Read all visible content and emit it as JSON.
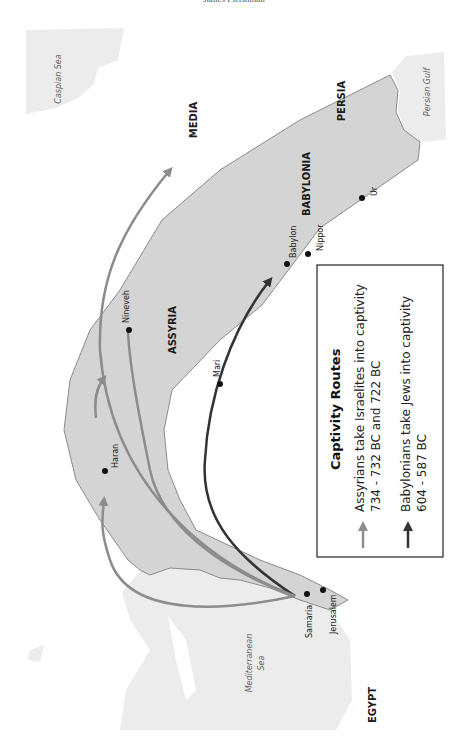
{
  "header": {
    "text": "James Fleishman"
  },
  "map": {
    "colors": {
      "region_fill": "#d4d4d4",
      "region_stroke": "#8a8a8a",
      "sea_fill": "#ececec",
      "assyrian_route": "#8c8c8c",
      "babylonian_route": "#333333",
      "city_dot": "#111111"
    },
    "seas": {
      "caspian": "Caspian Sea",
      "persian_gulf": "Persian Gulf",
      "mediterranean_line1": "Mediterranean",
      "mediterranean_line2": "Sea"
    },
    "regions": {
      "media": "MEDIA",
      "persia": "PERSIA",
      "babylonia": "BABYLONIA",
      "assyria": "ASSYRIA",
      "egypt": "EGYPT"
    },
    "cities": {
      "ur": "Ur",
      "nippor": "Nippor",
      "babylon": "Babylon",
      "nineveh": "Nineveh",
      "mari": "Mari",
      "haran": "Haran",
      "samaria": "Samaria",
      "jerusalem": "Jerusalem"
    }
  },
  "legend": {
    "title": "Captivity Routes",
    "items": [
      {
        "line1": "Assyrians take Israelites into captivity",
        "line2": "734 - 732 BC and 722 BC",
        "color": "#8c8c8c"
      },
      {
        "line1": "Babylonians take Jews into captivity",
        "line2": "604 - 587 BC",
        "color": "#333333"
      }
    ]
  }
}
